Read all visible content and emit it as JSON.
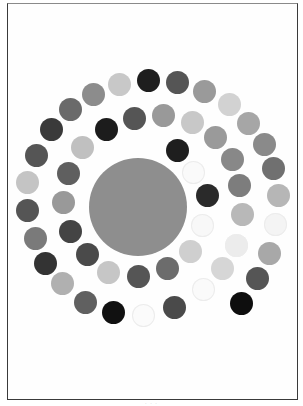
{
  "figure": {
    "frame": {
      "left": 7,
      "top": 3,
      "right": 298,
      "bottom": 399
    },
    "center_disc": {
      "cx": 138,
      "cy": 207,
      "r": 49,
      "color": "#8e8e8e"
    },
    "dot_radius": 11.5,
    "dots": [
      {
        "cx": 119,
        "cy": 84,
        "color": "#c8c8c8"
      },
      {
        "cx": 93,
        "cy": 94,
        "color": "#8c8c8c"
      },
      {
        "cx": 70,
        "cy": 109,
        "color": "#6a6a6a"
      },
      {
        "cx": 51,
        "cy": 129,
        "color": "#3a3a3a"
      },
      {
        "cx": 36,
        "cy": 155,
        "color": "#555555"
      },
      {
        "cx": 27,
        "cy": 182,
        "color": "#c4c4c4"
      },
      {
        "cx": 27,
        "cy": 210,
        "color": "#555555"
      },
      {
        "cx": 35,
        "cy": 238,
        "color": "#7a7a7a"
      },
      {
        "cx": 45,
        "cy": 263,
        "color": "#333333"
      },
      {
        "cx": 62,
        "cy": 283,
        "color": "#b0b0b0"
      },
      {
        "cx": 85,
        "cy": 302,
        "color": "#606060"
      },
      {
        "cx": 113,
        "cy": 312,
        "color": "#111111"
      },
      {
        "cx": 143,
        "cy": 315,
        "color": "#fbfbfb",
        "faint": true
      },
      {
        "cx": 174,
        "cy": 307,
        "color": "#4a4a4a"
      },
      {
        "cx": 203,
        "cy": 289,
        "color": "#fafafa",
        "faint": true
      },
      {
        "cx": 148,
        "cy": 80,
        "color": "#1e1e1e"
      },
      {
        "cx": 177,
        "cy": 82,
        "color": "#555555"
      },
      {
        "cx": 204,
        "cy": 91,
        "color": "#9a9a9a"
      },
      {
        "cx": 229,
        "cy": 104,
        "color": "#d2d2d2"
      },
      {
        "cx": 248,
        "cy": 123,
        "color": "#a6a6a6"
      },
      {
        "cx": 264,
        "cy": 144,
        "color": "#8a8a8a"
      },
      {
        "cx": 273,
        "cy": 168,
        "color": "#707070"
      },
      {
        "cx": 278,
        "cy": 195,
        "color": "#b6b6b6"
      },
      {
        "cx": 275,
        "cy": 224,
        "color": "#f4f4f4",
        "faint": true
      },
      {
        "cx": 269,
        "cy": 253,
        "color": "#a8a8a8"
      },
      {
        "cx": 257,
        "cy": 278,
        "color": "#555555"
      },
      {
        "cx": 241,
        "cy": 303,
        "color": "#0e0e0e"
      },
      {
        "cx": 106,
        "cy": 129,
        "color": "#1c1c1c"
      },
      {
        "cx": 134,
        "cy": 118,
        "color": "#555555"
      },
      {
        "cx": 163,
        "cy": 115,
        "color": "#999999"
      },
      {
        "cx": 192,
        "cy": 122,
        "color": "#c8c8c8"
      },
      {
        "cx": 215,
        "cy": 137,
        "color": "#9a9a9a"
      },
      {
        "cx": 232,
        "cy": 159,
        "color": "#888888"
      },
      {
        "cx": 239,
        "cy": 185,
        "color": "#7d7d7d"
      },
      {
        "cx": 242,
        "cy": 214,
        "color": "#b8b8b8"
      },
      {
        "cx": 236,
        "cy": 245,
        "color": "#ececec",
        "faint": true
      },
      {
        "cx": 222,
        "cy": 268,
        "color": "#d6d6d6"
      },
      {
        "cx": 82,
        "cy": 147,
        "color": "#c0c0c0"
      },
      {
        "cx": 68,
        "cy": 173,
        "color": "#5f5f5f"
      },
      {
        "cx": 63,
        "cy": 202,
        "color": "#999999"
      },
      {
        "cx": 70,
        "cy": 231,
        "color": "#444444"
      },
      {
        "cx": 87,
        "cy": 254,
        "color": "#4a4a4a"
      },
      {
        "cx": 108,
        "cy": 272,
        "color": "#c6c6c6"
      },
      {
        "cx": 138,
        "cy": 276,
        "color": "#555555"
      },
      {
        "cx": 167,
        "cy": 268,
        "color": "#6c6c6c"
      },
      {
        "cx": 190,
        "cy": 251,
        "color": "#cfcfcf"
      },
      {
        "cx": 177,
        "cy": 150,
        "color": "#1e1e1e"
      },
      {
        "cx": 193,
        "cy": 172,
        "color": "#fafafa",
        "faint": true
      },
      {
        "cx": 207,
        "cy": 195,
        "color": "#2a2a2a"
      },
      {
        "cx": 202,
        "cy": 225,
        "color": "#f8f8f8",
        "faint": true
      }
    ]
  },
  "caption": "· · ·"
}
